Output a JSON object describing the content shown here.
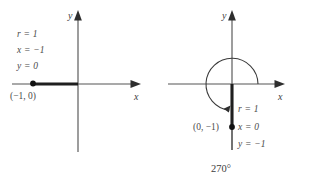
{
  "figure": {
    "background_color": "#ffffff",
    "stroke_color": "#555555",
    "text_color": "#4a4a4a",
    "accent_color": "#1f1f1f"
  },
  "left_diagram": {
    "name": "180-degree-angle-diagram",
    "axis_x_label": "x",
    "axis_y_label": "y",
    "equations": [
      {
        "text": "r = 1"
      },
      {
        "text": "x = −1"
      },
      {
        "text": "y = 0"
      }
    ],
    "point_label": "(−1, 0)",
    "terminal_side": {
      "from": "(−1, 0)",
      "to": "(0, 0)",
      "direction": "negative-x-axis"
    }
  },
  "right_diagram": {
    "name": "270-degree-angle-diagram",
    "axis_x_label": "x",
    "axis_y_label": "y",
    "equations": [
      {
        "text": "r = 1"
      },
      {
        "text": "x = 0"
      },
      {
        "text": "y = −1"
      }
    ],
    "point_label": "(0, −1)",
    "angle_label": "270°",
    "terminal_side": {
      "from": "(0, 0)",
      "to": "(0, −1)",
      "direction": "negative-y-axis"
    },
    "arc": {
      "start_angle_deg": 0,
      "end_angle_deg": 270,
      "sweep": "counterclockwise",
      "radius_px": 26
    }
  }
}
